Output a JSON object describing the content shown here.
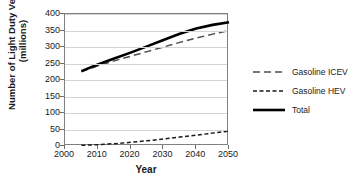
{
  "chart_data": {
    "type": "line",
    "title": "",
    "xlabel": "Year",
    "ylabel_line1": "Number of Light Duty Vehicles",
    "ylabel_line2": "(millions)",
    "x": [
      2005,
      2010,
      2015,
      2020,
      2025,
      2030,
      2035,
      2040,
      2045,
      2050
    ],
    "xlim": [
      2000,
      2050
    ],
    "ylim": [
      0,
      400
    ],
    "xticks": [
      "2000",
      "2010",
      "2020",
      "2030",
      "2040",
      "2050"
    ],
    "xtick_values": [
      2000,
      2010,
      2020,
      2030,
      2040,
      2050
    ],
    "yticks": [
      "0",
      "50",
      "100",
      "150",
      "200",
      "250",
      "300",
      "350",
      "400"
    ],
    "ytick_values": [
      0,
      50,
      100,
      150,
      200,
      250,
      300,
      350,
      400
    ],
    "grid": "horizontal",
    "legend_position": "right",
    "series": [
      {
        "name": "Gasoline ICEV",
        "style": "long-dashed",
        "color": "#4d4d4d",
        "values": [
          225,
          243,
          258,
          272,
          286,
          300,
          314,
          327,
          339,
          350
        ]
      },
      {
        "name": "Gasoline HEV",
        "style": "short-dashed",
        "color": "#1a1a1a",
        "values": [
          2,
          4,
          7,
          11,
          16,
          21,
          27,
          33,
          39,
          45
        ]
      },
      {
        "name": "Total",
        "style": "solid-thick",
        "color": "#000000",
        "values": [
          227,
          247,
          265,
          283,
          302,
          321,
          340,
          356,
          367,
          375
        ]
      }
    ]
  },
  "legend": {
    "items": [
      {
        "label": "Gasoline ICEV"
      },
      {
        "label": "Gasoline HEV"
      },
      {
        "label": "Total"
      }
    ]
  }
}
